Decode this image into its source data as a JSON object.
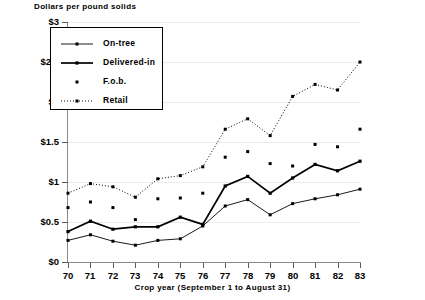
{
  "chart_data": {
    "type": "line",
    "title": "Dollars per pound solids",
    "ylabel": "Dollars per pound solids",
    "xlabel": "Crop year (September 1 to August 31)",
    "categories": [
      "70",
      "71",
      "72",
      "73",
      "74",
      "75",
      "76",
      "77",
      "78",
      "79",
      "80",
      "81",
      "82",
      "83"
    ],
    "x": [
      70,
      71,
      72,
      73,
      74,
      75,
      76,
      77,
      78,
      79,
      80,
      81,
      82,
      83
    ],
    "ylim": [
      0,
      3
    ],
    "ytick_values": [
      0,
      0.5,
      1,
      1.5,
      2,
      2.5,
      3
    ],
    "ytick_labels": [
      "$0",
      "$0.5",
      "$1",
      "$1.5",
      "$2",
      "$2.5",
      "$3"
    ],
    "grid": true,
    "legend_position": "top-left",
    "series": [
      {
        "name": "On-tree",
        "style": "thin-line-with-markers",
        "values": [
          0.27,
          0.34,
          0.26,
          0.21,
          0.27,
          0.29,
          0.45,
          0.7,
          0.78,
          0.59,
          0.73,
          0.79,
          0.84,
          0.91
        ]
      },
      {
        "name": "Delivered-in",
        "style": "thick-line-with-markers",
        "values": [
          0.38,
          0.51,
          0.41,
          0.44,
          0.44,
          0.56,
          0.47,
          0.95,
          1.07,
          0.86,
          1.05,
          1.22,
          1.14,
          1.26
        ]
      },
      {
        "name": "F.o.b.",
        "style": "markers-only",
        "values": [
          0.68,
          0.75,
          0.68,
          0.53,
          0.79,
          0.8,
          0.86,
          1.31,
          1.38,
          1.23,
          1.2,
          1.47,
          1.44,
          1.66
        ]
      },
      {
        "name": "Retail",
        "style": "dotted-line-with-markers",
        "values": [
          0.86,
          0.98,
          0.94,
          0.81,
          1.04,
          1.08,
          1.19,
          1.66,
          1.79,
          1.58,
          2.07,
          2.22,
          2.15,
          2.5
        ]
      }
    ]
  },
  "legend": {
    "items": [
      {
        "label": "On-tree"
      },
      {
        "label": "Delivered-in"
      },
      {
        "label": "F.o.b."
      },
      {
        "label": "Retail"
      }
    ]
  }
}
